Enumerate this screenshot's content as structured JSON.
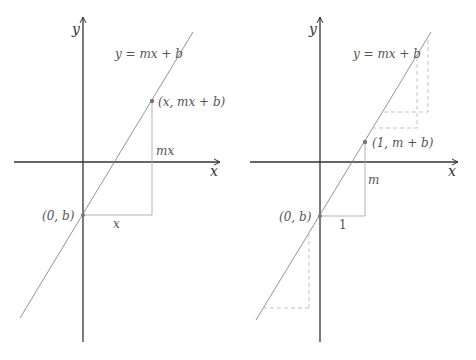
{
  "panels": [
    {
      "id": "left",
      "axis_labels": {
        "x": "x",
        "y": "y"
      },
      "line_label": "y = mx + b",
      "point_label": "(x, mx + b)",
      "intercept_label": "(0, b)",
      "rise_label": "mx",
      "run_label": "x"
    },
    {
      "id": "right",
      "axis_labels": {
        "x": "x",
        "y": "y"
      },
      "line_label": "y = mx + b",
      "point_label": "(1, m + b)",
      "intercept_label": "(0, b)",
      "rise_label": "m",
      "run_label": "1"
    }
  ],
  "colors": {
    "axis": "#333333",
    "line": "#888888",
    "guide": "#aaaaaa",
    "dashed": "#bbbbbb",
    "text": "#555555"
  }
}
